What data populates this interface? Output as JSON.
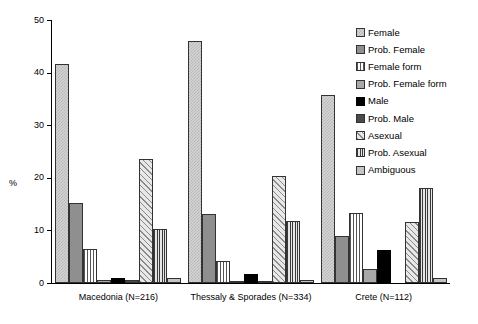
{
  "chart_data": {
    "type": "bar",
    "title": "",
    "xlabel": "",
    "ylabel": "%",
    "ylim": [
      0,
      50
    ],
    "yticks": [
      0,
      10,
      20,
      30,
      40,
      50
    ],
    "grid": false,
    "legend_position": "right",
    "categories": [
      "Macedonia (N=216)",
      "Thessaly & Sporades (N=334)",
      "Crete (N=112)"
    ],
    "series": [
      {
        "name": "Female",
        "pattern": "light-checkerboard",
        "values": [
          41.7,
          46.1,
          35.7
        ]
      },
      {
        "name": "Prob. Female",
        "pattern": "solid-medium-grey",
        "values": [
          15.3,
          13.2,
          8.9
        ]
      },
      {
        "name": "Female form",
        "pattern": "vertical-stripes",
        "values": [
          6.5,
          4.2,
          13.4
        ]
      },
      {
        "name": "Prob. Female form",
        "pattern": "solid-light-grey",
        "values": [
          0.5,
          0.3,
          2.7
        ]
      },
      {
        "name": "Male",
        "pattern": "solid-black",
        "values": [
          0.9,
          1.8,
          6.3
        ]
      },
      {
        "name": "Prob. Male",
        "pattern": "dark-grey",
        "values": [
          0.5,
          0.3,
          0.0
        ]
      },
      {
        "name": "Asexual",
        "pattern": "diagonal-hatch",
        "values": [
          23.6,
          20.4,
          11.6
        ]
      },
      {
        "name": "Prob. Asexual",
        "pattern": "dense-vertical",
        "values": [
          10.2,
          11.7,
          18.1
        ]
      },
      {
        "name": "Ambiguous",
        "pattern": "solid-pale-grey",
        "values": [
          0.9,
          0.6,
          0.9
        ]
      }
    ]
  },
  "axis": {
    "y_title": "%",
    "y_ticks": [
      "0",
      "10",
      "20",
      "30",
      "40",
      "50"
    ]
  },
  "legend": {
    "items": [
      {
        "label": "Female"
      },
      {
        "label": "Prob. Female"
      },
      {
        "label": "Female form"
      },
      {
        "label": "Prob. Female form"
      },
      {
        "label": "Male"
      },
      {
        "label": "Prob. Male"
      },
      {
        "label": "Asexual"
      },
      {
        "label": "Prob. Asexual"
      },
      {
        "label": "Ambiguous"
      }
    ]
  },
  "groups": [
    {
      "label": "Macedonia (N=216)"
    },
    {
      "label": "Thessaly & Sporades (N=334)"
    },
    {
      "label": "Crete (N=112)"
    }
  ]
}
